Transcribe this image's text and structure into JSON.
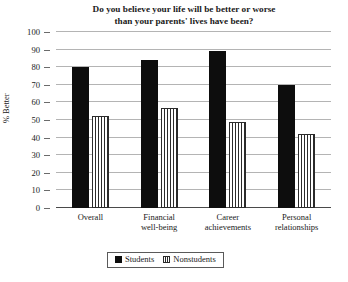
{
  "chart_data": {
    "type": "bar",
    "title": "Do you believe your life will be better or worse than your parents' lives have been?",
    "title_lines": [
      "Do you believe your life will be better or worse",
      "than your parents' lives have been?"
    ],
    "xlabel": "",
    "ylabel": "% Better",
    "ylim": [
      0,
      100
    ],
    "ytick_step": 10,
    "yticks": [
      0,
      10,
      20,
      30,
      40,
      50,
      60,
      70,
      80,
      90,
      100
    ],
    "grid": true,
    "legend_position": "bottom-center",
    "categories": [
      "Overall",
      "Financial well-being",
      "Career achievements",
      "Personal relationships"
    ],
    "category_lines": [
      [
        "Overall"
      ],
      [
        "Financial",
        "well-being"
      ],
      [
        "Career",
        "achievements"
      ],
      [
        "Personal",
        "relationships"
      ]
    ],
    "series": [
      {
        "name": "Students",
        "fill": "solid",
        "color": "#0d0d0d",
        "values": [
          80,
          84,
          89,
          70
        ]
      },
      {
        "name": "Nonstudents",
        "fill": "vertical-stripes",
        "color": "#2b2b2b",
        "values": [
          52,
          57,
          49,
          42
        ]
      }
    ]
  },
  "legend": {
    "items": [
      {
        "label": "Students"
      },
      {
        "label": "Nonstudents"
      }
    ]
  }
}
